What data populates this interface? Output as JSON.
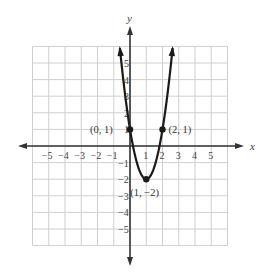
{
  "chart_data": {
    "type": "line",
    "title": "",
    "xlabel": "x",
    "ylabel": "y",
    "xlim": [
      -6,
      6
    ],
    "ylim": [
      -6,
      6
    ],
    "grid": true,
    "x_ticks": [
      -5,
      -4,
      -3,
      -2,
      -1,
      1,
      2,
      3,
      4,
      5
    ],
    "y_ticks": [
      -5,
      -4,
      -3,
      -2,
      -1,
      1,
      2,
      3,
      4,
      5
    ],
    "x_tick_labels": [
      "−5",
      "−4",
      "−3",
      "−2",
      "−1",
      "1",
      "2",
      "3",
      "4",
      "5"
    ],
    "y_tick_labels": [
      "−5",
      "−4",
      "−3",
      "−2",
      "−1",
      "1",
      "2",
      "3",
      "4",
      "5"
    ],
    "series": [
      {
        "name": "parabola",
        "equation": "y = 3x^2 - 6x + 1",
        "x": [
          -0.4,
          0,
          0.5,
          1,
          1.5,
          2,
          2.4
        ],
        "y": [
          3.88,
          1,
          -1.25,
          -2,
          -1.25,
          1,
          3.88
        ]
      }
    ],
    "points": [
      {
        "x": 0,
        "y": 1,
        "label": "(0, 1)"
      },
      {
        "x": 2,
        "y": 1,
        "label": "(2, 1)"
      },
      {
        "x": 1,
        "y": -2,
        "label": "(1, −2)"
      }
    ],
    "annotations": [
      "(0, 1)",
      "(2, 1)",
      "(1, −2)"
    ],
    "colors": {
      "curve": "#1a1a1a",
      "grid": "#cfcfcf",
      "axis": "#333333"
    }
  }
}
